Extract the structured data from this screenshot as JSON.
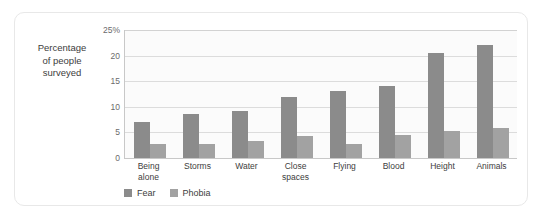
{
  "chart_data": {
    "type": "bar",
    "title": "",
    "xlabel": "",
    "ylabel": "Percentage\nof people\nsurveyed",
    "ylim": [
      0,
      25
    ],
    "yticks": [
      "0",
      "5",
      "10",
      "15",
      "20",
      "25%"
    ],
    "ytick_values": [
      0,
      5,
      10,
      15,
      20,
      25
    ],
    "grid": true,
    "legend_position": "bottom-left",
    "categories": [
      "Being\nalone",
      "Storms",
      "Water",
      "Close\nspaces",
      "Flying",
      "Blood",
      "Height",
      "Animals"
    ],
    "series": [
      {
        "name": "Fear",
        "color": "#8b8b8b",
        "values": [
          7,
          8.5,
          9.2,
          12,
          13,
          14,
          20.5,
          22
        ]
      },
      {
        "name": "Phobia",
        "color": "#a2a2a2",
        "values": [
          2.8,
          2.7,
          3.3,
          4.3,
          2.7,
          4.4,
          5.3,
          5.8
        ]
      }
    ]
  }
}
